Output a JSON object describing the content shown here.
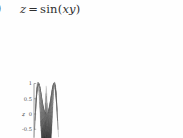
{
  "caption": {
    "item_paren": ")",
    "expr_z": "z",
    "expr_eq": "=",
    "expr_fn": "sin(",
    "expr_args": "xy",
    "expr_close": ")",
    "full_text": "z = sin(xy)"
  },
  "chart_data": {
    "type": "surface",
    "xlabel": "x",
    "ylabel": "y",
    "zlabel": "z",
    "xlim": [
      -2,
      2
    ],
    "ylim": [
      -2,
      2
    ],
    "zlim": [
      -1,
      1
    ],
    "xticks": [
      "-2",
      "-1",
      "0",
      "1",
      "2"
    ],
    "xtick_values": [
      -2,
      -1,
      0,
      1,
      2
    ],
    "yticks": [
      "-2",
      "-1",
      "0",
      "1",
      "2"
    ],
    "ytick_values": [
      -2,
      -1,
      0,
      1,
      2
    ],
    "zticks": [
      "1",
      "0.5",
      "0",
      "-0.5",
      "-1"
    ],
    "ztick_values": [
      1,
      0.5,
      0,
      -0.5,
      -1
    ],
    "function": "sin(x*y)",
    "colormap": "gray",
    "mesh": true,
    "grid": false,
    "legend": false,
    "projection": "3d",
    "view_elevation": 30,
    "view_azimuth": -60,
    "surface_colors": {
      "low": "#2b2b2b",
      "mid": "#9a9a9a",
      "high": "#efefef",
      "edge": "#6d6d6d"
    },
    "samples": 25
  },
  "colors": {
    "background": "#fefefe",
    "axis": "#555555",
    "text": "#3a3a3a"
  }
}
